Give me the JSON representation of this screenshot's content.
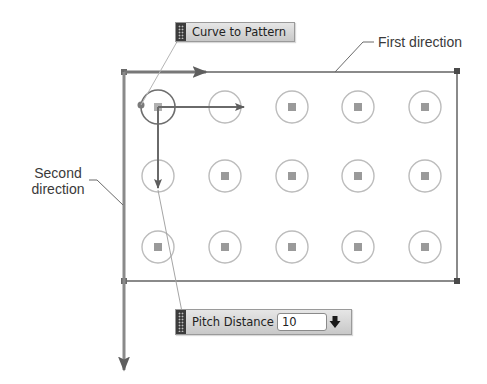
{
  "diagram": {
    "callouts": {
      "first_direction": "First direction",
      "second_direction_line1": "Second",
      "second_direction_line2": "direction"
    },
    "toolbars": {
      "curve_to_pattern": {
        "label": "Curve to Pattern"
      },
      "pitch_distance": {
        "label": "Pitch Distance",
        "value": "10",
        "dropdown_icon": "arrow-down-icon"
      }
    },
    "pattern": {
      "columns": 5,
      "rows": 3,
      "column_x": [
        158,
        225,
        292,
        358,
        425
      ],
      "row_y": [
        107,
        176,
        247
      ],
      "boundary": {
        "left": 124,
        "top": 72,
        "right": 457,
        "bottom": 281
      }
    },
    "colors": {
      "line": "#7a7a7a",
      "circle": "#b9b9b9",
      "circle_selected": "#6e6e6e",
      "marker": "#9a9a9a",
      "arrow": "#6a6a6a"
    }
  }
}
